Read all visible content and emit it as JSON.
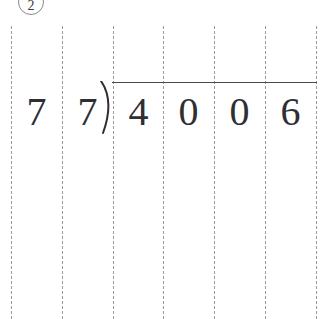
{
  "page": {
    "background_color": "#ffffff",
    "ink_color": "#2e2e33",
    "guide_color": "#9a9aa4",
    "rule_color": "#4a4a4a",
    "badge_color": "#8a8a8a"
  },
  "problem": {
    "number_label": "2",
    "badge_shape": "circle"
  },
  "division": {
    "operation": "long-division",
    "divisor": "77",
    "dividend": "4006",
    "divisor_digits": [
      "7",
      "7"
    ],
    "dividend_digits": [
      "4",
      "0",
      "0",
      "6"
    ],
    "bracket_glyph": ")",
    "quotient_digits": [
      "",
      "",
      "",
      ""
    ]
  },
  "guides": {
    "count": 7,
    "x_positions": [
      11,
      62,
      113,
      163,
      214,
      265,
      316
    ],
    "style": "dashed",
    "top": 26
  },
  "digit_slots": [
    {
      "name": "divisor-tens",
      "value": "7",
      "left": 11
    },
    {
      "name": "divisor-ones",
      "value": "7",
      "left": 62
    },
    {
      "name": "dividend-d1",
      "value": "4",
      "left": 113
    },
    {
      "name": "dividend-d2",
      "value": "0",
      "left": 163
    },
    {
      "name": "dividend-d3",
      "value": "0",
      "left": 214
    },
    {
      "name": "dividend-d4",
      "value": "6",
      "left": 265
    }
  ],
  "vinculum": {
    "left": 112,
    "top": 82,
    "width": 205
  }
}
